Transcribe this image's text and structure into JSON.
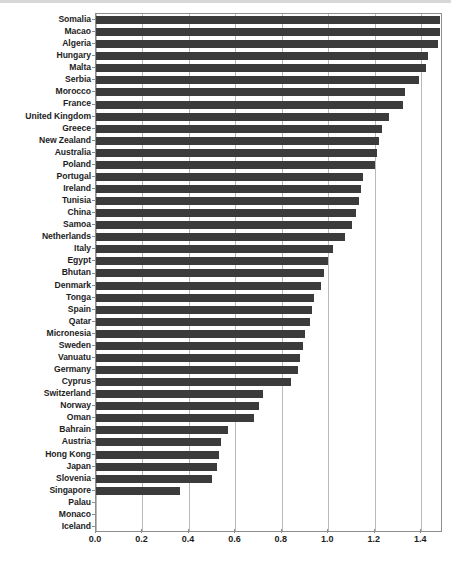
{
  "chart_data": {
    "type": "bar",
    "orientation": "horizontal",
    "title": "",
    "subtitle": "",
    "xlabel": "",
    "ylabel": "",
    "xlim": [
      0.0,
      1.4935
    ],
    "xticks": [
      0.0,
      0.2,
      0.4,
      0.6,
      0.8,
      1.0,
      1.2,
      1.4
    ],
    "xtick_labels": [
      "0.0",
      "0.2",
      "0.4",
      "0.6",
      "0.8",
      "1.0",
      "1.2",
      "1.4"
    ],
    "grid": true,
    "grid_axis": "x",
    "legend": null,
    "bar_color": "#3b3b3b",
    "categories": [
      "Somalia",
      "Macao",
      "Algeria",
      "Hungary",
      "Malta",
      "Serbia",
      "Morocco",
      "France",
      "United Kingdom",
      "Greece",
      "New Zealand",
      "Australia",
      "Poland",
      "Portugal",
      "Ireland",
      "Tunisia",
      "China",
      "Samoa",
      "Netherlands",
      "Italy",
      "Egypt",
      "Bhutan",
      "Denmark",
      "Tonga",
      "Spain",
      "Qatar",
      "Micronesia",
      "Sweden",
      "Vanuatu",
      "Germany",
      "Cyprus",
      "Switzerland",
      "Norway",
      "Oman",
      "Bahrain",
      "Austria",
      "Hong Kong",
      "Japan",
      "Slovenia",
      "Singapore",
      "Palau",
      "Monaco",
      "Iceland"
    ],
    "values": [
      1.48,
      1.48,
      1.47,
      1.43,
      1.42,
      1.39,
      1.33,
      1.32,
      1.26,
      1.23,
      1.22,
      1.21,
      1.2,
      1.15,
      1.14,
      1.13,
      1.12,
      1.1,
      1.07,
      1.02,
      1.0,
      0.98,
      0.97,
      0.94,
      0.93,
      0.92,
      0.9,
      0.89,
      0.88,
      0.87,
      0.84,
      0.72,
      0.7,
      0.68,
      0.57,
      0.54,
      0.53,
      0.52,
      0.5,
      0.36,
      0.0,
      0.0,
      0.0
    ]
  },
  "axis": {
    "x_tick_labels": [
      "0.0",
      "0.2",
      "0.4",
      "0.6",
      "0.8",
      "1.0",
      "1.2",
      "1.4"
    ]
  },
  "colors": {
    "bar": "#3b3b3b",
    "grid": "#b9b9b9",
    "axis": "#8d8d8d",
    "text": "#1d1d1d",
    "background": "#ffffff",
    "top_border": "#d8d8d8"
  }
}
